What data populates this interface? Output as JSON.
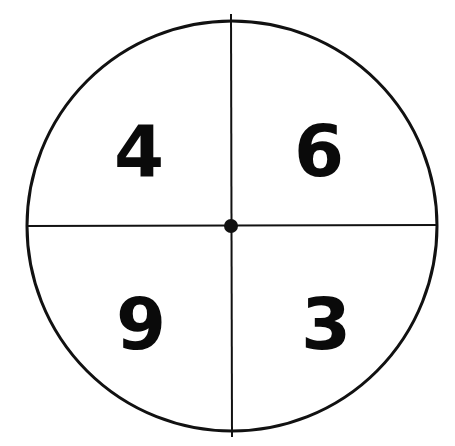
{
  "spinner": {
    "center": {
      "x": 232,
      "y": 226
    },
    "radius": 205,
    "stroke_color": "#111111",
    "background_color": "#ffffff",
    "sections": [
      {
        "position": "top-left",
        "label": "4"
      },
      {
        "position": "top-right",
        "label": "6"
      },
      {
        "position": "bottom-left",
        "label": "9"
      },
      {
        "position": "bottom-right",
        "label": "3"
      }
    ]
  }
}
